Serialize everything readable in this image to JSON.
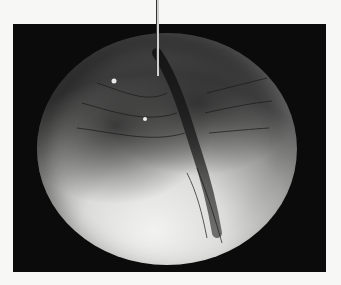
{
  "figure": {
    "background_color": "#0b0b0b",
    "page_color": "#f7f7f5",
    "pointer": {
      "target": "cleavage-furrow",
      "label": ""
    }
  }
}
